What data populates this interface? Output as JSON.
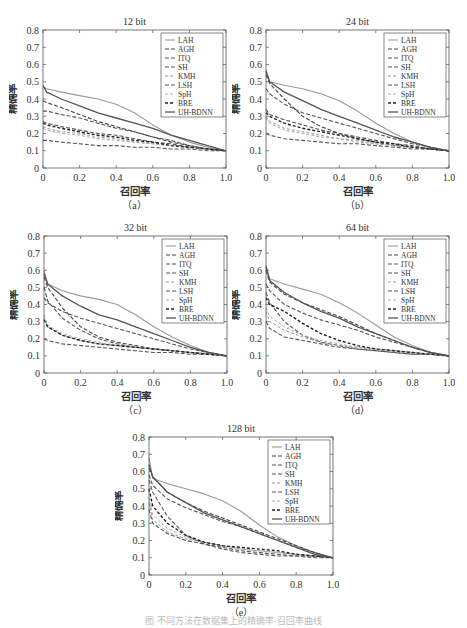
{
  "figure_caption": "图  不同方法在数据集上的精确率-召回率曲线",
  "legend_labels": [
    "LAH",
    "AGH",
    "ITQ",
    "SH",
    "KMH",
    "LSH",
    "SpH",
    "BRE",
    "UH-BDNN"
  ],
  "series_styles": {
    "LAH": {
      "color": "#9a9a9a",
      "dash": "",
      "width": 1.1
    },
    "AGH": {
      "color": "#444444",
      "dash": "4,2",
      "width": 1.1
    },
    "ITQ": {
      "color": "#555555",
      "dash": "4,2",
      "width": 1.1
    },
    "SH": {
      "color": "#555555",
      "dash": "4,2",
      "width": 1.1
    },
    "KMH": {
      "color": "#999999",
      "dash": "3,2",
      "width": 1.0
    },
    "LSH": {
      "color": "#555555",
      "dash": "4,2",
      "width": 1.1
    },
    "SpH": {
      "color": "#aaaaaa",
      "dash": "3,2",
      "width": 1.0
    },
    "BRE": {
      "color": "#222222",
      "dash": "3,2",
      "width": 1.4
    },
    "UH-BDNN": {
      "color": "#555555",
      "dash": "",
      "width": 1.3
    }
  },
  "chart_data": [
    {
      "id": "a",
      "type": "line",
      "title": "12 bit",
      "sublabel": "（a）",
      "xlabel": "召回率",
      "ylabel": "精确率",
      "xlim": [
        0,
        1.0
      ],
      "ylim": [
        0,
        0.8
      ],
      "xticks": [
        "0",
        "0.2",
        "0.4",
        "0.6",
        "0.8",
        "1.0"
      ],
      "yticks": [
        "0",
        "0.1",
        "0.2",
        "0.3",
        "0.4",
        "0.5",
        "0.6",
        "0.7",
        "0.8"
      ],
      "legend_position": "upper right",
      "grid": false,
      "x": [
        0,
        0.02,
        0.1,
        0.2,
        0.3,
        0.4,
        0.5,
        0.6,
        0.7,
        0.8,
        0.9,
        1.0
      ],
      "series": [
        {
          "name": "LAH",
          "values": [
            0.47,
            0.46,
            0.44,
            0.42,
            0.4,
            0.37,
            0.32,
            0.25,
            0.19,
            0.15,
            0.12,
            0.1
          ]
        },
        {
          "name": "AGH",
          "values": [
            0.39,
            0.38,
            0.35,
            0.31,
            0.27,
            0.24,
            0.21,
            0.18,
            0.15,
            0.13,
            0.11,
            0.1
          ]
        },
        {
          "name": "ITQ",
          "values": [
            0.33,
            0.33,
            0.31,
            0.29,
            0.26,
            0.23,
            0.21,
            0.18,
            0.16,
            0.13,
            0.11,
            0.1
          ]
        },
        {
          "name": "SH",
          "values": [
            0.27,
            0.26,
            0.24,
            0.22,
            0.2,
            0.19,
            0.17,
            0.15,
            0.14,
            0.12,
            0.11,
            0.1
          ]
        },
        {
          "name": "KMH",
          "values": [
            0.24,
            0.23,
            0.21,
            0.2,
            0.18,
            0.17,
            0.15,
            0.14,
            0.13,
            0.12,
            0.11,
            0.1
          ]
        },
        {
          "name": "LSH",
          "values": [
            0.16,
            0.16,
            0.15,
            0.14,
            0.13,
            0.13,
            0.12,
            0.12,
            0.11,
            0.11,
            0.1,
            0.1
          ]
        },
        {
          "name": "SpH",
          "values": [
            0.23,
            0.22,
            0.2,
            0.19,
            0.17,
            0.16,
            0.15,
            0.14,
            0.13,
            0.12,
            0.11,
            0.1
          ]
        },
        {
          "name": "BRE",
          "values": [
            0.26,
            0.25,
            0.23,
            0.21,
            0.19,
            0.18,
            0.16,
            0.15,
            0.13,
            0.12,
            0.11,
            0.1
          ]
        },
        {
          "name": "UH-BDNN",
          "values": [
            0.48,
            0.44,
            0.4,
            0.36,
            0.32,
            0.29,
            0.26,
            0.23,
            0.19,
            0.16,
            0.13,
            0.1
          ]
        }
      ]
    },
    {
      "id": "b",
      "type": "line",
      "title": "24 bit",
      "sublabel": "（b）",
      "xlabel": "召回率",
      "ylabel": "精确率",
      "xlim": [
        0,
        1.0
      ],
      "ylim": [
        0,
        0.8
      ],
      "xticks": [
        "0",
        "0.2",
        "0.4",
        "0.6",
        "0.8",
        "1.0"
      ],
      "yticks": [
        "0",
        "0.1",
        "0.2",
        "0.3",
        "0.4",
        "0.5",
        "0.6",
        "0.7",
        "0.8"
      ],
      "legend_position": "upper right",
      "grid": false,
      "x": [
        0,
        0.02,
        0.1,
        0.2,
        0.3,
        0.4,
        0.5,
        0.6,
        0.7,
        0.8,
        0.9,
        1.0
      ],
      "series": [
        {
          "name": "LAH",
          "values": [
            0.57,
            0.5,
            0.48,
            0.46,
            0.43,
            0.39,
            0.33,
            0.26,
            0.2,
            0.15,
            0.12,
            0.1
          ]
        },
        {
          "name": "AGH",
          "values": [
            0.54,
            0.49,
            0.4,
            0.3,
            0.24,
            0.2,
            0.17,
            0.15,
            0.13,
            0.12,
            0.11,
            0.1
          ]
        },
        {
          "name": "ITQ",
          "values": [
            0.46,
            0.43,
            0.37,
            0.32,
            0.29,
            0.26,
            0.23,
            0.2,
            0.17,
            0.14,
            0.12,
            0.1
          ]
        },
        {
          "name": "SH",
          "values": [
            0.34,
            0.31,
            0.28,
            0.25,
            0.22,
            0.2,
            0.18,
            0.16,
            0.14,
            0.13,
            0.11,
            0.1
          ]
        },
        {
          "name": "KMH",
          "values": [
            0.3,
            0.27,
            0.23,
            0.21,
            0.19,
            0.17,
            0.16,
            0.14,
            0.13,
            0.12,
            0.11,
            0.1
          ]
        },
        {
          "name": "LSH",
          "values": [
            0.2,
            0.19,
            0.17,
            0.16,
            0.15,
            0.14,
            0.14,
            0.13,
            0.12,
            0.11,
            0.11,
            0.1
          ]
        },
        {
          "name": "SpH",
          "values": [
            0.29,
            0.26,
            0.22,
            0.2,
            0.18,
            0.17,
            0.15,
            0.14,
            0.13,
            0.12,
            0.11,
            0.1
          ]
        },
        {
          "name": "BRE",
          "values": [
            0.32,
            0.3,
            0.26,
            0.23,
            0.21,
            0.19,
            0.17,
            0.15,
            0.14,
            0.12,
            0.11,
            0.1
          ]
        },
        {
          "name": "UH-BDNN",
          "values": [
            0.56,
            0.5,
            0.44,
            0.39,
            0.34,
            0.3,
            0.26,
            0.22,
            0.18,
            0.15,
            0.12,
            0.1
          ]
        }
      ]
    },
    {
      "id": "c",
      "type": "line",
      "title": "32 bit",
      "sublabel": "（c）",
      "xlabel": "召回率",
      "ylabel": "精确率",
      "xlim": [
        0,
        1.0
      ],
      "ylim": [
        0,
        0.8
      ],
      "xticks": [
        "0",
        "0.2",
        "0.4",
        "0.6",
        "0.8",
        "1.0"
      ],
      "yticks": [
        "0",
        "0.1",
        "0.2",
        "0.3",
        "0.4",
        "0.5",
        "0.6",
        "0.7",
        "0.8"
      ],
      "legend_position": "upper right",
      "grid": false,
      "x": [
        0,
        0.02,
        0.1,
        0.2,
        0.3,
        0.4,
        0.5,
        0.6,
        0.7,
        0.8,
        0.9,
        1.0
      ],
      "series": [
        {
          "name": "LAH",
          "values": [
            0.6,
            0.52,
            0.48,
            0.45,
            0.43,
            0.4,
            0.34,
            0.27,
            0.21,
            0.16,
            0.12,
            0.1
          ]
        },
        {
          "name": "AGH",
          "values": [
            0.56,
            0.5,
            0.38,
            0.27,
            0.21,
            0.18,
            0.16,
            0.14,
            0.13,
            0.12,
            0.11,
            0.1
          ]
        },
        {
          "name": "ITQ",
          "values": [
            0.44,
            0.41,
            0.36,
            0.32,
            0.29,
            0.26,
            0.23,
            0.2,
            0.17,
            0.14,
            0.12,
            0.1
          ]
        },
        {
          "name": "SH",
          "values": [
            0.5,
            0.42,
            0.32,
            0.25,
            0.2,
            0.17,
            0.15,
            0.14,
            0.13,
            0.12,
            0.11,
            0.1
          ]
        },
        {
          "name": "KMH",
          "values": [
            0.32,
            0.27,
            0.22,
            0.19,
            0.17,
            0.16,
            0.15,
            0.14,
            0.13,
            0.12,
            0.11,
            0.1
          ]
        },
        {
          "name": "LSH",
          "values": [
            0.2,
            0.19,
            0.17,
            0.16,
            0.15,
            0.14,
            0.13,
            0.12,
            0.12,
            0.11,
            0.11,
            0.1
          ]
        },
        {
          "name": "SpH",
          "values": [
            0.34,
            0.28,
            0.23,
            0.2,
            0.18,
            0.16,
            0.15,
            0.14,
            0.13,
            0.12,
            0.11,
            0.1
          ]
        },
        {
          "name": "BRE",
          "values": [
            0.31,
            0.27,
            0.22,
            0.19,
            0.17,
            0.16,
            0.15,
            0.14,
            0.13,
            0.12,
            0.11,
            0.1
          ]
        },
        {
          "name": "UH-BDNN",
          "values": [
            0.58,
            0.52,
            0.45,
            0.39,
            0.34,
            0.31,
            0.27,
            0.23,
            0.19,
            0.15,
            0.12,
            0.1
          ]
        }
      ]
    },
    {
      "id": "d",
      "type": "line",
      "title": "64 bit",
      "sublabel": "（d）",
      "xlabel": "召回率",
      "ylabel": "精确率",
      "xlim": [
        0,
        1.0
      ],
      "ylim": [
        0,
        0.8
      ],
      "xticks": [
        "0",
        "0.2",
        "0.4",
        "0.6",
        "0.8",
        "1.0"
      ],
      "yticks": [
        "0",
        "0.1",
        "0.2",
        "0.3",
        "0.4",
        "0.5",
        "0.6",
        "0.7",
        "0.8"
      ],
      "legend_position": "upper right",
      "grid": false,
      "x": [
        0,
        0.02,
        0.1,
        0.2,
        0.3,
        0.4,
        0.5,
        0.6,
        0.7,
        0.8,
        0.9,
        1.0
      ],
      "series": [
        {
          "name": "LAH",
          "values": [
            0.63,
            0.55,
            0.52,
            0.49,
            0.46,
            0.41,
            0.35,
            0.28,
            0.21,
            0.16,
            0.12,
            0.1
          ]
        },
        {
          "name": "AGH",
          "values": [
            0.6,
            0.53,
            0.46,
            0.41,
            0.37,
            0.33,
            0.28,
            0.23,
            0.19,
            0.15,
            0.12,
            0.1
          ]
        },
        {
          "name": "ITQ",
          "values": [
            0.52,
            0.48,
            0.4,
            0.35,
            0.31,
            0.28,
            0.25,
            0.21,
            0.18,
            0.15,
            0.12,
            0.1
          ]
        },
        {
          "name": "SH",
          "values": [
            0.47,
            0.41,
            0.3,
            0.22,
            0.18,
            0.16,
            0.14,
            0.13,
            0.12,
            0.11,
            0.11,
            0.1
          ]
        },
        {
          "name": "KMH",
          "values": [
            0.36,
            0.3,
            0.25,
            0.21,
            0.18,
            0.16,
            0.15,
            0.14,
            0.13,
            0.12,
            0.11,
            0.1
          ]
        },
        {
          "name": "LSH",
          "values": [
            0.3,
            0.26,
            0.21,
            0.19,
            0.17,
            0.15,
            0.14,
            0.13,
            0.12,
            0.11,
            0.11,
            0.1
          ]
        },
        {
          "name": "SpH",
          "values": [
            0.38,
            0.33,
            0.27,
            0.22,
            0.19,
            0.17,
            0.15,
            0.14,
            0.13,
            0.12,
            0.11,
            0.1
          ]
        },
        {
          "name": "BRE",
          "values": [
            0.44,
            0.4,
            0.36,
            0.29,
            0.23,
            0.19,
            0.16,
            0.14,
            0.13,
            0.12,
            0.11,
            0.1
          ]
        },
        {
          "name": "UH-BDNN",
          "values": [
            0.62,
            0.54,
            0.47,
            0.41,
            0.36,
            0.32,
            0.27,
            0.23,
            0.19,
            0.15,
            0.12,
            0.1
          ]
        }
      ]
    },
    {
      "id": "e",
      "type": "line",
      "title": "128 bit",
      "sublabel": "（e）",
      "xlabel": "召回率",
      "ylabel": "精确率",
      "xlim": [
        0,
        1.0
      ],
      "ylim": [
        0,
        0.8
      ],
      "xticks": [
        "0",
        "0.2",
        "0.4",
        "0.6",
        "0.8",
        "1.0"
      ],
      "yticks": [
        "0",
        "0.1",
        "0.2",
        "0.3",
        "0.4",
        "0.5",
        "0.6",
        "0.7",
        "0.8"
      ],
      "legend_position": "upper right",
      "grid": false,
      "x": [
        0,
        0.02,
        0.1,
        0.2,
        0.3,
        0.4,
        0.5,
        0.6,
        0.7,
        0.8,
        0.9,
        1.0
      ],
      "series": [
        {
          "name": "LAH",
          "values": [
            0.68,
            0.56,
            0.53,
            0.5,
            0.47,
            0.43,
            0.37,
            0.29,
            0.22,
            0.17,
            0.13,
            0.1
          ]
        },
        {
          "name": "AGH",
          "values": [
            0.62,
            0.57,
            0.48,
            0.42,
            0.37,
            0.33,
            0.29,
            0.25,
            0.21,
            0.17,
            0.13,
            0.1
          ]
        },
        {
          "name": "ITQ",
          "values": [
            0.58,
            0.52,
            0.44,
            0.39,
            0.35,
            0.31,
            0.28,
            0.24,
            0.2,
            0.16,
            0.13,
            0.1
          ]
        },
        {
          "name": "SH",
          "values": [
            0.55,
            0.48,
            0.34,
            0.23,
            0.18,
            0.15,
            0.13,
            0.12,
            0.11,
            0.11,
            0.1,
            0.1
          ]
        },
        {
          "name": "KMH",
          "values": [
            0.42,
            0.32,
            0.25,
            0.21,
            0.19,
            0.17,
            0.15,
            0.14,
            0.13,
            0.12,
            0.11,
            0.1
          ]
        },
        {
          "name": "LSH",
          "values": [
            0.38,
            0.3,
            0.24,
            0.2,
            0.18,
            0.16,
            0.14,
            0.13,
            0.12,
            0.11,
            0.11,
            0.1
          ]
        },
        {
          "name": "SpH",
          "values": [
            0.45,
            0.35,
            0.27,
            0.22,
            0.19,
            0.17,
            0.15,
            0.14,
            0.13,
            0.12,
            0.11,
            0.1
          ]
        },
        {
          "name": "BRE",
          "values": [
            0.5,
            0.4,
            0.3,
            0.23,
            0.19,
            0.17,
            0.16,
            0.15,
            0.14,
            0.12,
            0.11,
            0.1
          ]
        },
        {
          "name": "UH-BDNN",
          "values": [
            0.64,
            0.57,
            0.48,
            0.42,
            0.36,
            0.32,
            0.28,
            0.24,
            0.2,
            0.16,
            0.12,
            0.1
          ]
        }
      ]
    }
  ],
  "layout": {
    "a": {
      "left": 43,
      "top": 30,
      "right": 226,
      "bottom": 168
    },
    "b": {
      "left": 266,
      "top": 30,
      "right": 449,
      "bottom": 168
    },
    "c": {
      "left": 44,
      "top": 236,
      "right": 227,
      "bottom": 373
    },
    "d": {
      "left": 266,
      "top": 236,
      "right": 449,
      "bottom": 373
    },
    "e": {
      "left": 149,
      "top": 437,
      "right": 333,
      "bottom": 575
    }
  }
}
